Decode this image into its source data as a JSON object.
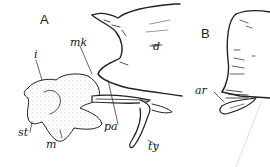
{
  "figure": {
    "panels": [
      {
        "id": "A",
        "label": "A",
        "structures": [
          {
            "abbr": "i"
          },
          {
            "abbr": "mk"
          },
          {
            "abbr": "d"
          },
          {
            "abbr": "st"
          },
          {
            "abbr": "m"
          },
          {
            "abbr": "pa"
          },
          {
            "abbr": "ty"
          }
        ]
      },
      {
        "id": "B",
        "label": "B",
        "structures": [
          {
            "abbr": "ar"
          }
        ]
      }
    ],
    "colors": {
      "ink": "#222222",
      "stipple": "#9a9a9a",
      "background": "#ffffff"
    }
  }
}
